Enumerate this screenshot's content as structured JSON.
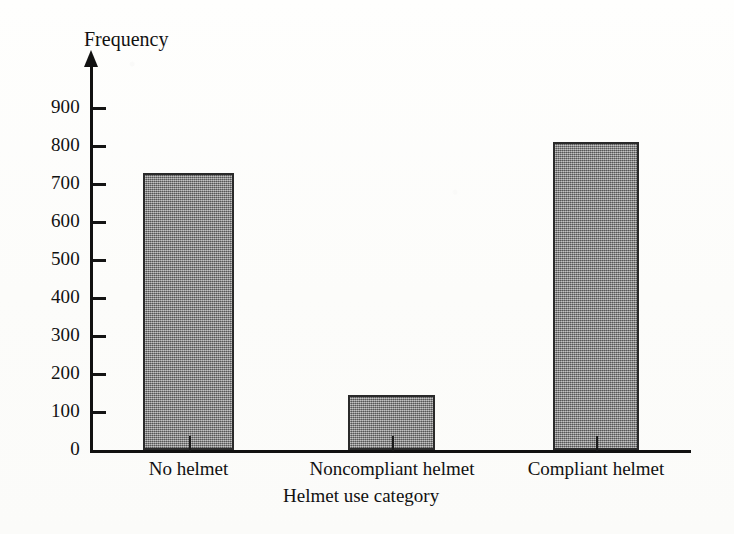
{
  "chart_data": {
    "type": "bar",
    "title": "",
    "subtitle": "",
    "xlabel": "Helmet use category",
    "ylabel": "Frequency",
    "categories": [
      "No helmet",
      "Noncompliant helmet",
      "Compliant helmet"
    ],
    "values": [
      730,
      145,
      810
    ],
    "series": [
      {
        "name": "Frequency",
        "values": [
          730,
          145,
          810
        ]
      }
    ],
    "ylim": [
      0,
      900
    ],
    "yticks": [
      0,
      100,
      200,
      300,
      400,
      500,
      600,
      700,
      800,
      900
    ],
    "ytick_labels": [
      "0",
      "100",
      "200",
      "300",
      "400",
      "500",
      "600",
      "700",
      "800",
      "900"
    ],
    "grid": false,
    "legend": false,
    "legend_position": "none",
    "bar_fill_color": "#8a8a8a",
    "bar_edge_color": "#2a2a2a",
    "axis_color": "#111111",
    "background_color": "#fdfdfb",
    "y_axis_has_arrow": true,
    "annotations": []
  },
  "axes": {
    "y_title": "Frequency",
    "x_title": "Helmet use category",
    "y_ticks": [
      {
        "label": "900",
        "value": 900
      },
      {
        "label": "800",
        "value": 800
      },
      {
        "label": "700",
        "value": 700
      },
      {
        "label": "600",
        "value": 600
      },
      {
        "label": "500",
        "value": 500
      },
      {
        "label": "400",
        "value": 400
      },
      {
        "label": "300",
        "value": 300
      },
      {
        "label": "200",
        "value": 200
      },
      {
        "label": "100",
        "value": 100
      },
      {
        "label": "0",
        "value": 0
      }
    ]
  },
  "bars": [
    {
      "label": "No helmet",
      "value": 730
    },
    {
      "label": "Noncompliant helmet",
      "value": 145
    },
    {
      "label": "Compliant helmet",
      "value": 810
    }
  ]
}
